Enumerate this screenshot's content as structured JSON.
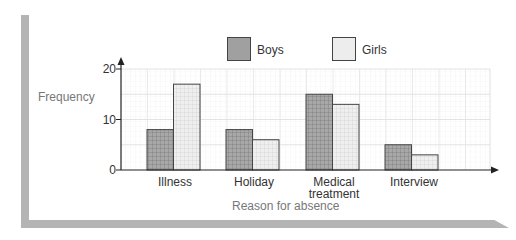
{
  "chart_data": {
    "type": "bar",
    "title": "",
    "xlabel": "Reason for absence",
    "ylabel": "Frequency",
    "categories": [
      "Illness",
      "Holiday",
      "Medical treatment",
      "Interview"
    ],
    "category_lines": [
      [
        "Illness"
      ],
      [
        "Holiday"
      ],
      [
        "Medical",
        "treatment"
      ],
      [
        "Interview"
      ]
    ],
    "series": [
      {
        "name": "Boys",
        "values": [
          8,
          8,
          15,
          5
        ],
        "color": "#9a9a9a"
      },
      {
        "name": "Girls",
        "values": [
          17,
          6,
          13,
          3
        ],
        "color": "#ececec"
      }
    ],
    "ylim": [
      0,
      20
    ],
    "yticks": [
      0,
      10,
      20
    ],
    "grid": true,
    "legend_position": "top"
  },
  "legend": {
    "boys_label": "Boys",
    "girls_label": "Girls"
  },
  "axis": {
    "ylabel": "Frequency",
    "xlabel": "Reason for absence",
    "ytick_0": "0",
    "ytick_10": "10",
    "ytick_20": "20"
  },
  "categories": {
    "c0": "Illness",
    "c1": "Holiday",
    "c2_line1": "Medical",
    "c2_line2": "treatment",
    "c3": "Interview"
  }
}
